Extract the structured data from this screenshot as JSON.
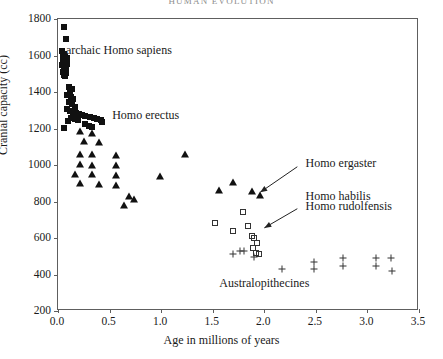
{
  "running_head": "HUMAN EVOLUTION",
  "chart_data": {
    "type": "scatter",
    "title": "",
    "xlabel": "Age in millions of years",
    "ylabel": "Cranial capacity (cc)",
    "xlim": [
      0.0,
      3.5
    ],
    "ylim": [
      200,
      1800
    ],
    "xticks": [
      "0.0",
      "0.5",
      "1.0",
      "1.5",
      "2.0",
      "2.5",
      "3.0",
      "3.5"
    ],
    "xtick_values": [
      0.0,
      0.5,
      1.0,
      1.5,
      2.0,
      2.5,
      3.0,
      3.5
    ],
    "yticks": [
      "200",
      "400",
      "600",
      "800",
      "1000",
      "1200",
      "1400",
      "1600",
      "1800"
    ],
    "ytick_values": [
      200,
      400,
      600,
      800,
      1000,
      1200,
      1400,
      1600,
      1800
    ],
    "grid": false,
    "legend": "none",
    "annotations": [
      {
        "name": "archaic-homo-sapiens",
        "text": "archaic Homo sapiens",
        "x": 0.6,
        "y": 1620
      },
      {
        "name": "homo-erectus",
        "text": "Homo erectus",
        "x": 0.86,
        "y": 1265
      },
      {
        "name": "homo-ergaster",
        "text": "Homo ergaster",
        "x": 2.41,
        "y": 1000
      },
      {
        "name": "homo-habilis",
        "text": "Homo habilis",
        "x": 2.41,
        "y": 820
      },
      {
        "name": "homo-rudolfensis",
        "text": "Homo rudolfensis",
        "x": 2.41,
        "y": 762
      },
      {
        "name": "australopithecines",
        "text": "Australopithecines",
        "x": 2.01,
        "y": 345
      }
    ],
    "arrows": [
      {
        "name": "ergaster-arrow",
        "from_x": 2.33,
        "from_y": 985,
        "to_x": 1.97,
        "to_y": 845
      },
      {
        "name": "habilis-arrow",
        "from_x": 2.33,
        "from_y": 755,
        "to_x": 2.01,
        "to_y": 650
      }
    ],
    "series": [
      {
        "name": "archaic Homo sapiens",
        "marker": "filled-square",
        "points": [
          [
            0.055,
            1755
          ],
          [
            0.075,
            1690
          ],
          [
            0.035,
            1625
          ],
          [
            0.055,
            1610
          ],
          [
            0.045,
            1600
          ],
          [
            0.065,
            1592
          ],
          [
            0.085,
            1585
          ],
          [
            0.05,
            1572
          ],
          [
            0.07,
            1562
          ],
          [
            0.09,
            1556
          ],
          [
            0.04,
            1548
          ],
          [
            0.06,
            1540
          ],
          [
            0.08,
            1532
          ],
          [
            0.062,
            1522
          ],
          [
            0.048,
            1512
          ],
          [
            0.078,
            1505
          ],
          [
            0.058,
            1495
          ],
          [
            0.068,
            1486
          ],
          [
            0.105,
            1430
          ],
          [
            0.135,
            1418
          ],
          [
            0.115,
            1398
          ],
          [
            0.09,
            1382
          ],
          [
            0.125,
            1372
          ],
          [
            0.15,
            1360
          ],
          [
            0.105,
            1345
          ],
          [
            0.135,
            1332
          ],
          [
            0.165,
            1320
          ],
          [
            0.085,
            1305
          ],
          [
            0.115,
            1296
          ],
          [
            0.145,
            1290
          ],
          [
            0.175,
            1284
          ],
          [
            0.205,
            1278
          ],
          [
            0.235,
            1272
          ],
          [
            0.265,
            1268
          ],
          [
            0.13,
            1258
          ],
          [
            0.16,
            1252
          ],
          [
            0.19,
            1246
          ],
          [
            0.1,
            1240
          ],
          [
            0.06,
            1205
          ],
          [
            0.31,
            1262
          ],
          [
            0.345,
            1258
          ],
          [
            0.38,
            1250
          ],
          [
            0.415,
            1246
          ],
          [
            0.3,
            1215
          ],
          [
            0.33,
            1210
          ],
          [
            0.43,
            1238
          ],
          [
            0.265,
            1226
          ]
        ]
      },
      {
        "name": "Homo erectus",
        "marker": "filled-triangle",
        "points": [
          [
            0.215,
            1185
          ],
          [
            0.33,
            1178
          ],
          [
            0.25,
            1130
          ],
          [
            0.4,
            1125
          ],
          [
            0.215,
            1062
          ],
          [
            0.33,
            1058
          ],
          [
            0.56,
            1055
          ],
          [
            1.235,
            1060
          ],
          [
            0.215,
            1008
          ],
          [
            0.33,
            1002
          ],
          [
            0.56,
            1000
          ],
          [
            0.16,
            952
          ],
          [
            0.33,
            948
          ],
          [
            0.56,
            945
          ],
          [
            0.985,
            940
          ],
          [
            0.215,
            902
          ],
          [
            0.4,
            898
          ],
          [
            0.56,
            892
          ],
          [
            0.69,
            830
          ],
          [
            0.74,
            812
          ],
          [
            0.64,
            782
          ],
          [
            1.56,
            862
          ],
          [
            1.7,
            905
          ],
          [
            1.88,
            855
          ],
          [
            1.96,
            838
          ]
        ]
      },
      {
        "name": "Homo habilis / Homo rudolfensis",
        "marker": "open-square",
        "points": [
          [
            1.52,
            680
          ],
          [
            1.79,
            745
          ],
          [
            1.7,
            640
          ],
          [
            1.84,
            668
          ],
          [
            1.88,
            612
          ],
          [
            1.905,
            598
          ],
          [
            1.925,
            575
          ],
          [
            1.895,
            545
          ],
          [
            1.915,
            520
          ],
          [
            1.95,
            512
          ]
        ]
      },
      {
        "name": "Australopithecines",
        "marker": "plus",
        "points": [
          [
            1.695,
            512
          ],
          [
            1.76,
            528
          ],
          [
            1.8,
            530
          ],
          [
            1.905,
            498
          ],
          [
            2.175,
            432
          ],
          [
            2.48,
            470
          ],
          [
            2.48,
            432
          ],
          [
            2.76,
            492
          ],
          [
            2.76,
            448
          ],
          [
            3.08,
            492
          ],
          [
            3.08,
            448
          ],
          [
            3.23,
            492
          ],
          [
            3.24,
            418
          ]
        ]
      }
    ]
  }
}
